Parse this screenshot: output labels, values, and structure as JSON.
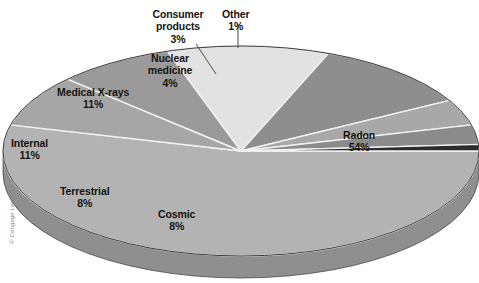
{
  "figure": {
    "title_clipped": "",
    "credit": "© Cengage Learning"
  },
  "chart_data": {
    "type": "pie",
    "title": "",
    "subtitle": "",
    "xlabel": "",
    "ylabel": "",
    "legend_position": "none",
    "style": "3d-exploded-none",
    "labels_inline": true,
    "categories": [
      "Radon",
      "Cosmic",
      "Terrestrial",
      "Internal",
      "Medical X-rays",
      "Nuclear medicine",
      "Consumer products",
      "Other"
    ],
    "values": [
      54,
      8,
      8,
      11,
      11,
      4,
      3,
      1
    ],
    "unit": "%",
    "total": 100,
    "slices": [
      {
        "name": "Radon",
        "label": "Radon",
        "pct_text": "54%",
        "value": 54,
        "color": "#b3b3b3",
        "side_color": "#8f8f8f",
        "label_x": 343,
        "label_y": 129,
        "leader": false
      },
      {
        "name": "Cosmic",
        "label": "Cosmic",
        "pct_text": "8%",
        "value": 8,
        "color": "#a6a6a6",
        "side_color": "#8a8a8a",
        "label_x": 158,
        "label_y": 208,
        "leader": false
      },
      {
        "name": "Terrestrial",
        "label": "Terrestrial",
        "pct_text": "8%",
        "value": 8,
        "color": "#9a9a9a",
        "side_color": "#6e6e6e",
        "label_x": 60,
        "label_y": 185,
        "leader": false
      },
      {
        "name": "Internal",
        "label": "Internal",
        "pct_text": "11%",
        "value": 11,
        "color": "#e2e2e2",
        "side_color": "#bdbdbd",
        "label_x": 11,
        "label_y": 137,
        "leader": false
      },
      {
        "name": "Medical X-rays",
        "label": "Medical X-rays",
        "pct_text": "11%",
        "value": 11,
        "color": "#8e8e8e",
        "side_color": "#6e6e6e",
        "label_x": 57,
        "label_y": 86,
        "leader": false
      },
      {
        "name": "Nuclear medicine",
        "label": "Nuclear medicine",
        "pct_text": "4%",
        "value": 4,
        "color": "#a8a8a8",
        "side_color": "#8a8a8a",
        "label_x": 142,
        "label_y": 52,
        "leader": false
      },
      {
        "name": "Consumer products",
        "label": "Consumer products",
        "pct_text": "3%",
        "value": 3,
        "color": "#8b8b8b",
        "side_color": "#6e6e6e",
        "label_x": 148,
        "label_y": 8,
        "leader": true
      },
      {
        "name": "Other",
        "label": "Other",
        "pct_text": "1%",
        "value": 1,
        "color": "#2b2b2b",
        "side_color": "#202020",
        "label_x": 222,
        "label_y": 8,
        "leader": true
      }
    ],
    "geometry": {
      "cx": 241,
      "cy": 151,
      "rx": 238,
      "ry": 105,
      "depth": 22,
      "start_angle_deg": 0
    },
    "colors": {
      "background": "#ffffff",
      "divider": "#f2f2f2",
      "outline": "#3a3a3a",
      "text": "#16130f",
      "credit": "#8d8d8d"
    }
  }
}
